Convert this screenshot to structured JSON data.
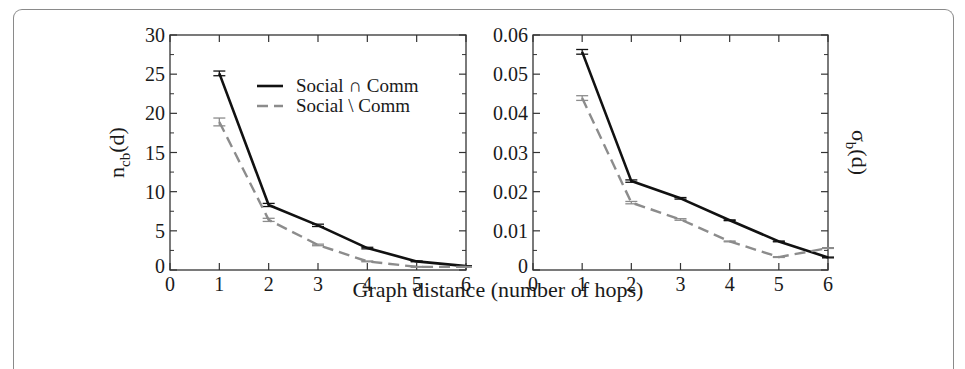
{
  "chart_data": [
    {
      "type": "line",
      "id": "left",
      "title": "",
      "xlabel": "Graph distance (number of hops)",
      "ylabel": "n_cb(d)",
      "ylabel_main": "n",
      "ylabel_sub": "cb",
      "ylabel_tail": "(d)",
      "xlim": [
        0,
        6
      ],
      "ylim": [
        0,
        30
      ],
      "xticks": [
        "0",
        "1",
        "2",
        "3",
        "4",
        "5",
        "6"
      ],
      "yticks": [
        "0",
        "5",
        "10",
        "15",
        "20",
        "25",
        "30"
      ],
      "yticks_values": [
        0,
        5,
        10,
        15,
        20,
        25,
        30
      ],
      "grid": false,
      "legend_position": "upper right (inside)",
      "x": [
        1,
        2,
        3,
        4,
        5,
        6
      ],
      "series": [
        {
          "name": "Social ∩ Comm",
          "style": "solid",
          "color": "#111111",
          "values": [
            25.1,
            8.3,
            5.7,
            2.8,
            1.1,
            0.5
          ],
          "errors": [
            0.3,
            0.2,
            0.15,
            0.1,
            0.05,
            0.05
          ]
        },
        {
          "name": "Social \\ Comm",
          "style": "dashed",
          "color": "#8c8c8c",
          "values": [
            18.9,
            6.4,
            3.2,
            1.1,
            0.4,
            0.4
          ],
          "errors": [
            0.5,
            0.2,
            0.1,
            0.05,
            0.05,
            0.05
          ]
        }
      ]
    },
    {
      "type": "line",
      "id": "right",
      "title": "",
      "xlabel": "Graph distance (number of hops)",
      "ylabel": "σ_b(d)",
      "ylabel_main": "σ",
      "ylabel_sub": "b",
      "ylabel_tail": "(d)",
      "xlim": [
        0,
        6
      ],
      "ylim": [
        0,
        0.06
      ],
      "xticks": [
        "0",
        "1",
        "2",
        "3",
        "4",
        "5",
        "6"
      ],
      "yticks": [
        "0",
        "0.01",
        "0.02",
        "0.03",
        "0.04",
        "0.05",
        "0.06"
      ],
      "yticks_values": [
        0,
        0.01,
        0.02,
        0.03,
        0.04,
        0.05,
        0.06
      ],
      "grid": false,
      "x": [
        1,
        2,
        3,
        4,
        5,
        6
      ],
      "series": [
        {
          "name": "Social ∩ Comm",
          "style": "solid",
          "color": "#111111",
          "values": [
            0.0557,
            0.0227,
            0.0183,
            0.0127,
            0.0073,
            0.0032
          ],
          "errors": [
            0.0006,
            0.0003,
            0.0002,
            0.0001,
            0.0001,
            0.0001
          ]
        },
        {
          "name": "Social \\ Comm",
          "style": "dashed",
          "color": "#8c8c8c",
          "values": [
            0.0439,
            0.0172,
            0.0129,
            0.0073,
            0.0033,
            0.0056
          ],
          "errors": [
            0.0006,
            0.0003,
            0.0002,
            0.0001,
            0.0001,
            0.0001
          ]
        }
      ]
    }
  ],
  "legend": {
    "items": [
      {
        "label": "Social ∩ Comm",
        "style": "solid",
        "color": "#111111"
      },
      {
        "label": "Social \\ Comm",
        "style": "dashed",
        "color": "#8c8c8c"
      }
    ]
  },
  "shared_xlabel": "Graph distance (number of hops)"
}
